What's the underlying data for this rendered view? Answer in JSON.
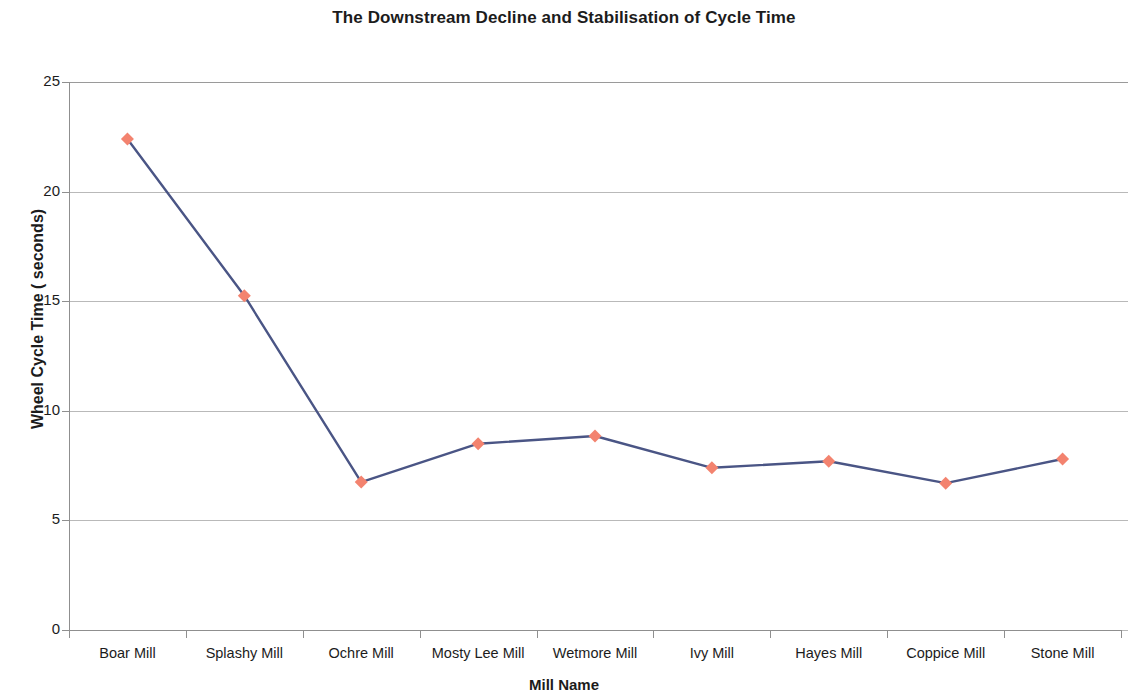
{
  "chart_data": {
    "type": "line",
    "title": "The Downstream Decline and Stabilisation of Cycle Time",
    "xlabel": "Mill Name",
    "ylabel": "Wheel Cycle Time ( seconds)",
    "categories": [
      "Boar Mill",
      "Splashy Mill",
      "Ochre Mill",
      "Mosty Lee Mill",
      "Wetmore Mill",
      "Ivy Mill",
      "Hayes Mill",
      "Coppice Mill",
      "Stone Mill"
    ],
    "values": [
      22.4,
      15.25,
      6.75,
      8.5,
      8.85,
      7.4,
      7.7,
      6.7,
      7.8
    ],
    "series": [
      {
        "name": "Wheel Cycle Time",
        "values": [
          22.4,
          15.25,
          6.75,
          8.5,
          8.85,
          7.4,
          7.7,
          6.7,
          7.8
        ],
        "line_color": "#4A5585",
        "marker_color": "#F3836F",
        "marker_shape": "diamond"
      }
    ],
    "ylim": [
      0,
      25
    ],
    "ytick_labels": [
      "0",
      "5",
      "10",
      "15",
      "20",
      "25"
    ],
    "ytick_values": [
      0,
      5,
      10,
      15,
      20,
      25
    ],
    "grid": true,
    "grid_axis": "y",
    "legend": false,
    "legend_position": "none",
    "colors": {
      "line": "#4A5585",
      "marker": "#F3836F",
      "grid": "#b9b9b9",
      "axis": "#8f8f8f",
      "text": "#1c1c1c",
      "background": "#ffffff"
    }
  }
}
